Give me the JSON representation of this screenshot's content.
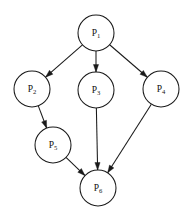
{
  "diagram": {
    "type": "directed-graph",
    "background_color": "#ffffff",
    "stroke_color": "#1a1a1a",
    "node_radius": 18,
    "nodes": [
      {
        "id": "P1",
        "label_main": "P",
        "label_sub": "1",
        "cx": 96,
        "cy": 33
      },
      {
        "id": "P2",
        "label_main": "P",
        "label_sub": "2",
        "cx": 32,
        "cy": 89
      },
      {
        "id": "P3",
        "label_main": "P",
        "label_sub": "3",
        "cx": 96,
        "cy": 90
      },
      {
        "id": "P4",
        "label_main": "P",
        "label_sub": "4",
        "cx": 161,
        "cy": 89
      },
      {
        "id": "P5",
        "label_main": "P",
        "label_sub": "5",
        "cx": 53,
        "cy": 145
      },
      {
        "id": "P6",
        "label_main": "P",
        "label_sub": "6",
        "cx": 98,
        "cy": 188
      }
    ],
    "edges": [
      {
        "id": "e1",
        "from": "P1",
        "to": "P2",
        "directed": true
      },
      {
        "id": "e2",
        "from": "P1",
        "to": "P3",
        "directed": true
      },
      {
        "id": "e3",
        "from": "P1",
        "to": "P4",
        "directed": true
      },
      {
        "id": "e4",
        "from": "P2",
        "to": "P5",
        "directed": true
      },
      {
        "id": "e5",
        "from": "P3",
        "to": "P6",
        "directed": true
      },
      {
        "id": "e6",
        "from": "P4",
        "to": "P6",
        "directed": true
      },
      {
        "id": "e7",
        "from": "P5",
        "to": "P6",
        "directed": true
      }
    ]
  }
}
